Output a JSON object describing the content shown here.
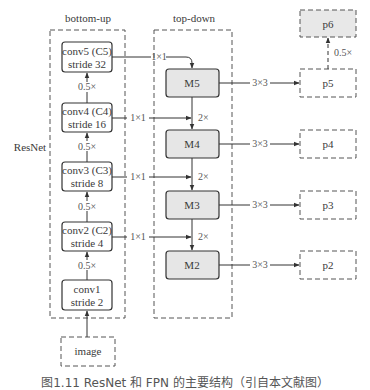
{
  "diagram": {
    "left_label": "ResNet",
    "bottom_up": {
      "title": "bottom-up",
      "stages": [
        {
          "id": "conv5",
          "line1": "conv5 (C5)",
          "line2": "stride 32"
        },
        {
          "id": "conv4",
          "line1": "conv4 (C4)",
          "line2": "stride 16"
        },
        {
          "id": "conv3",
          "line1": "conv3 (C3)",
          "line2": "stride 8"
        },
        {
          "id": "conv2",
          "line1": "conv2 (C2)",
          "line2": "stride 4"
        },
        {
          "id": "conv1",
          "line1": "conv1",
          "line2": "stride 2"
        }
      ],
      "downsample_labels": [
        "0.5×",
        "0.5×",
        "0.5×",
        "0.5×"
      ]
    },
    "input": {
      "label": "image"
    },
    "lateral_labels": [
      "1×1",
      "1×1",
      "1×1",
      "1×1"
    ],
    "top_down": {
      "title": "top-down",
      "nodes": [
        "M5",
        "M4",
        "M3",
        "M2"
      ],
      "upsample_labels": [
        "2×",
        "2×",
        "2×"
      ]
    },
    "output_conv_labels": [
      "3×3",
      "3×3",
      "3×3",
      "3×3"
    ],
    "outputs": {
      "p6": "p6",
      "p6_label": "0.5×",
      "levels": [
        "p5",
        "p4",
        "p3",
        "p2"
      ]
    },
    "caption": "图1.11  ResNet 和 FPN 的主要结构（引自本文献图）"
  }
}
